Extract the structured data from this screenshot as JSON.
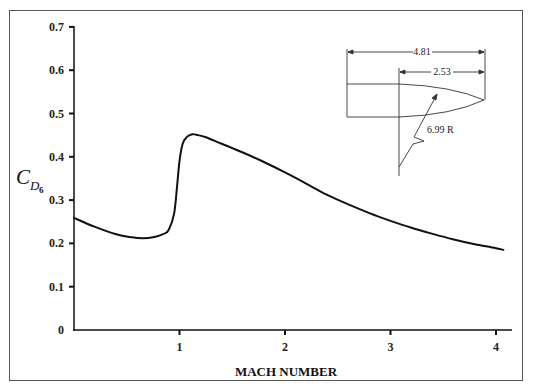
{
  "chart_data": {
    "type": "line",
    "title": "",
    "xlabel": "MACH NUMBER",
    "ylabel": "C_D6",
    "ylabel_main": "C",
    "ylabel_sub": "D",
    "ylabel_subsub": "6",
    "xlim": [
      0,
      4.1
    ],
    "ylim": [
      0,
      0.7
    ],
    "grid": false,
    "x_ticks": [
      1,
      2,
      3,
      4
    ],
    "x_tick_labels": [
      "1",
      "2",
      "3",
      "4"
    ],
    "y_ticks": [
      0,
      0.1,
      0.2,
      0.3,
      0.4,
      0.5,
      0.6,
      0.7
    ],
    "y_tick_labels": [
      "0",
      "0.1",
      "0.2",
      "0.3",
      "0.4",
      "0.5",
      "0.6",
      "0.7"
    ],
    "series": [
      {
        "name": "G6 drag coefficient",
        "x": [
          0.0,
          0.2,
          0.4,
          0.55,
          0.65,
          0.75,
          0.85,
          0.9,
          0.95,
          0.98,
          1.0,
          1.03,
          1.07,
          1.12,
          1.16,
          1.25,
          1.4,
          1.6,
          1.8,
          2.0,
          2.2,
          2.4,
          2.6,
          2.8,
          3.0,
          3.2,
          3.4,
          3.6,
          3.8,
          4.0,
          4.07
        ],
        "values": [
          0.259,
          0.238,
          0.221,
          0.214,
          0.212,
          0.214,
          0.222,
          0.232,
          0.27,
          0.34,
          0.39,
          0.43,
          0.446,
          0.452,
          0.451,
          0.445,
          0.43,
          0.41,
          0.388,
          0.364,
          0.338,
          0.312,
          0.29,
          0.27,
          0.252,
          0.236,
          0.222,
          0.209,
          0.198,
          0.189,
          0.185
        ]
      }
    ],
    "inset": {
      "description": "Projectile profile (G6 reference shape)",
      "total_length_label": "4.81",
      "ogive_length_label": "2.53",
      "ogive_radius_label": "6.99 R"
    }
  }
}
